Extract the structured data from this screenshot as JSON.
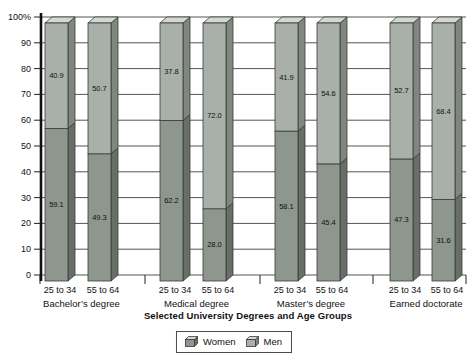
{
  "chart_data": {
    "type": "bar",
    "variant": "3d-stacked-100-percent",
    "title": "",
    "xlabel": "Selected University Degrees and Age Groups",
    "ylabel": "",
    "ylim": [
      0,
      100
    ],
    "ytick_step": 10,
    "ytick_labels": [
      "0",
      "10",
      "20",
      "30",
      "40",
      "50",
      "60",
      "70",
      "80",
      "90",
      "100%"
    ],
    "grid": true,
    "legend_position": "bottom-center",
    "groups": [
      "Bachelor’s degree",
      "Medical degree",
      "Master’s degree",
      "Earned doctorate"
    ],
    "categories": [
      "25 to 34",
      "55 to 64",
      "25 to 34",
      "55 to 64",
      "25 to 34",
      "55 to 64",
      "25 to 34",
      "55 to 64"
    ],
    "series": [
      {
        "name": "Women",
        "position": "bottom",
        "color": "#8e978e",
        "side_color": "#676f67",
        "values": [
          59.1,
          49.3,
          62.2,
          28.0,
          58.1,
          45.4,
          47.3,
          31.6
        ]
      },
      {
        "name": "Men",
        "position": "top",
        "color": "#a9b0a9",
        "side_color": "#7f877f",
        "values": [
          40.9,
          50.7,
          37.8,
          72.0,
          41.9,
          54.6,
          52.7,
          68.4
        ]
      }
    ],
    "top_face_color": "#d3d8d3",
    "outline_color": "#3a3a3a",
    "grid_color": "#555555",
    "text_color": "#111111"
  }
}
